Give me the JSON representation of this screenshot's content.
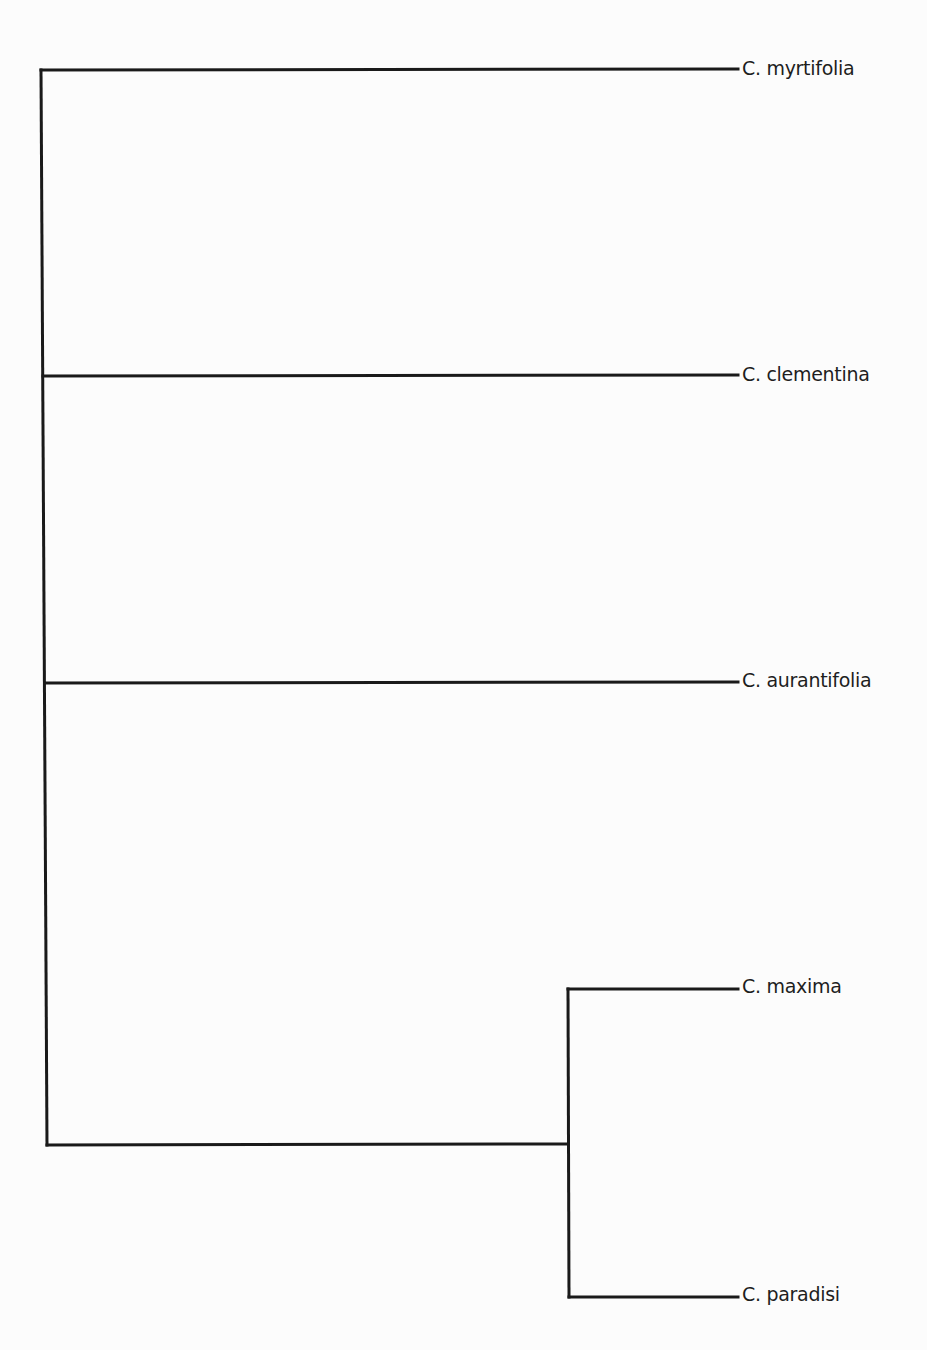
{
  "diagram": {
    "type": "phylogenetic-tree",
    "orientation": "left-to-right",
    "line_color": "#1a1a1a",
    "label_color": "#1e1e1e",
    "leaves": [
      {
        "id": "myrtifolia",
        "label": "C. myrtifolia",
        "y": 70
      },
      {
        "id": "clementina",
        "label": "C. clementina",
        "y": 376
      },
      {
        "id": "aurantifolia",
        "label": "C. aurantifolia",
        "y": 682
      },
      {
        "id": "maxima",
        "label": "C. maxima",
        "y": 989
      },
      {
        "id": "paradisi",
        "label": "C. paradisi",
        "y": 1297
      }
    ],
    "internal_nodes": [
      {
        "id": "root",
        "children": [
          "myrtifolia",
          "clementina",
          "aurantifolia",
          "clade-maxima-paradisi"
        ]
      },
      {
        "id": "clade-maxima-paradisi",
        "children": [
          "maxima",
          "paradisi"
        ]
      }
    ],
    "newick": "(C. myrtifolia,C. clementina,C. aurantifolia,(C. maxima,C. paradisi));"
  }
}
